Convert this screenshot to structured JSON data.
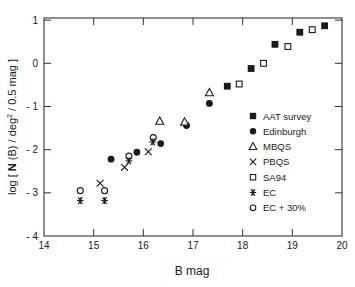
{
  "chart_data": {
    "type": "scatter",
    "title": "",
    "xlabel": "B mag",
    "ylabel_parts": {
      "prefix": "log [ ",
      "bold": "N",
      "middle": " (B) / deg",
      "sup": "2",
      "suffix": " / 0.5 mag ]"
    },
    "ylabel": "log [ N (B) / deg² / 0.5 mag ]",
    "xlim": [
      14,
      20
    ],
    "ylim": [
      -4,
      1.05
    ],
    "x_ticks": [
      14,
      15,
      16,
      17,
      18,
      19,
      20
    ],
    "y_ticks": [
      1,
      0,
      -1,
      -2,
      -3,
      -4
    ],
    "y_tick_labels": [
      "1",
      "0",
      "- 1",
      "- 2",
      "- 3",
      "- 4"
    ],
    "grid": false,
    "legend_position": "inside right",
    "series": [
      {
        "name": "AAT survey",
        "marker": "filled-square",
        "points": [
          [
            17.69,
            -0.53
          ],
          [
            18.17,
            -0.12
          ],
          [
            18.65,
            0.44
          ],
          [
            19.15,
            0.72
          ],
          [
            19.65,
            0.87
          ]
        ]
      },
      {
        "name": "Edinburgh",
        "marker": "filled-circle",
        "points": [
          [
            15.35,
            -2.22
          ],
          [
            15.87,
            -2.06
          ],
          [
            16.35,
            -1.86
          ],
          [
            16.87,
            -1.44
          ],
          [
            17.33,
            -0.93
          ]
        ]
      },
      {
        "name": "MBQS",
        "marker": "open-triangle",
        "points": [
          [
            16.33,
            -1.34
          ],
          [
            16.83,
            -1.36
          ],
          [
            17.33,
            -0.68
          ]
        ]
      },
      {
        "name": "PBQS",
        "marker": "cross",
        "points": [
          [
            15.13,
            -2.78
          ],
          [
            15.62,
            -2.41
          ],
          [
            16.1,
            -2.05
          ]
        ]
      },
      {
        "name": "SA94",
        "marker": "open-square",
        "points": [
          [
            17.93,
            -0.48
          ],
          [
            18.42,
            0.0
          ],
          [
            18.91,
            0.39
          ],
          [
            19.4,
            0.78
          ]
        ]
      },
      {
        "name": "EC",
        "marker": "asterisk",
        "points": [
          [
            14.73,
            -3.18
          ],
          [
            15.22,
            -3.18
          ],
          [
            15.71,
            -2.26
          ],
          [
            16.19,
            -1.82
          ]
        ]
      },
      {
        "name": "EC + 30%",
        "marker": "open-circle",
        "points": [
          [
            14.73,
            -2.95
          ],
          [
            15.22,
            -2.95
          ],
          [
            15.71,
            -2.15
          ],
          [
            16.2,
            -1.72
          ]
        ]
      }
    ]
  },
  "colors": {
    "ink": "#1a1a1a",
    "axis": "#333333",
    "background": "#ffffff"
  }
}
